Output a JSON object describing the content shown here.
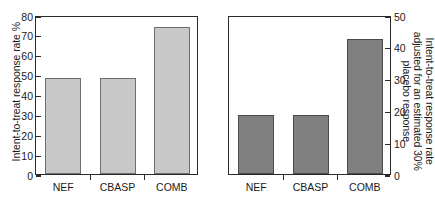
{
  "chart_data": [
    {
      "type": "bar",
      "panel": "left",
      "title": "",
      "xlabel": "",
      "ylabel": "Intent-to-treat response rate %",
      "categories": [
        "NEF",
        "CBASP",
        "COMB"
      ],
      "values": [
        48.5,
        48.5,
        74
      ],
      "ylim": [
        0,
        80
      ],
      "yticks": [
        0,
        10,
        20,
        30,
        40,
        50,
        60,
        70,
        80
      ],
      "ytick_labels": [
        "0",
        "10",
        "20",
        "30",
        "40",
        "50",
        "60",
        "70",
        "80"
      ],
      "axis_side": "left",
      "grid": false,
      "legend": "none",
      "bar_color": "#c8c8c8",
      "bar_edge_color": "#6e6e6e"
    },
    {
      "type": "bar",
      "panel": "right",
      "title": "",
      "xlabel": "",
      "ylabel": "Intent-to-treat response rate adjusted for an estimated 30% placebo response",
      "ylabel_lines": [
        "Intent-to-treat response rate",
        "adjusted for an estimated 30%",
        "placebo response"
      ],
      "categories": [
        "NEF",
        "CBASP",
        "COMB"
      ],
      "values": [
        18.5,
        18.5,
        42.5
      ],
      "ylim": [
        0,
        50
      ],
      "yticks": [
        0,
        10,
        20,
        30,
        40,
        50
      ],
      "ytick_labels": [
        "0",
        "10",
        "20",
        "30",
        "40",
        "50"
      ],
      "axis_side": "right",
      "grid": false,
      "legend": "none",
      "bar_color": "#808080",
      "bar_edge_color": "#4a4a4a"
    }
  ]
}
